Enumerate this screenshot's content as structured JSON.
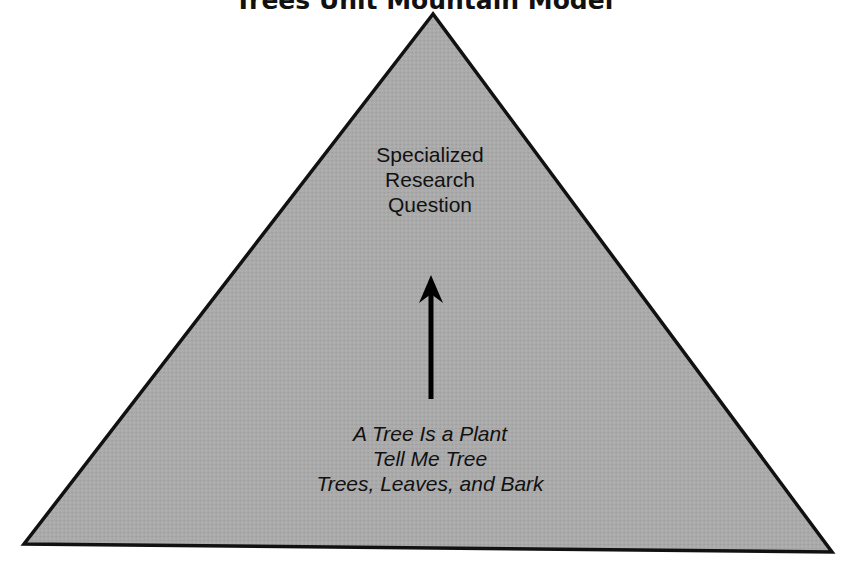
{
  "title": "Trees Unit Mountain Model",
  "diagram": {
    "shape": "triangle",
    "fill_color": "#a9a9a9",
    "stroke_color": "#111111",
    "apex_label": {
      "lines": [
        "Specialized",
        "Research",
        "Question"
      ]
    },
    "base_label": {
      "lines": [
        "A Tree Is a Plant",
        "Tell Me Tree",
        "Trees, Leaves, and Bark"
      ]
    },
    "arrow": {
      "direction": "up",
      "from": "base_label",
      "to": "apex_label"
    }
  }
}
